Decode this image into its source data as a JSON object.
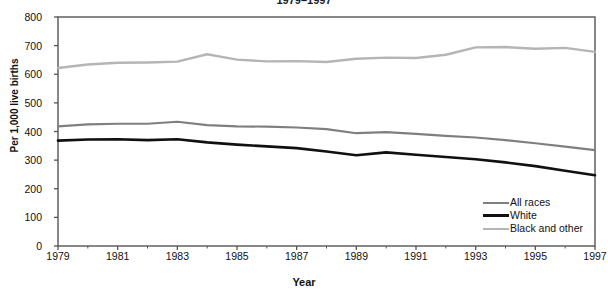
{
  "chart_data": {
    "type": "line",
    "title": "1979–1997",
    "xlabel": "Year",
    "ylabel": "Per 1,000 live births",
    "x": [
      1979,
      1980,
      1981,
      1982,
      1983,
      1984,
      1985,
      1986,
      1987,
      1988,
      1989,
      1990,
      1991,
      1992,
      1993,
      1994,
      1995,
      1996,
      1997
    ],
    "xlim": [
      1979,
      1997
    ],
    "ylim": [
      0,
      800
    ],
    "xticks": [
      1979,
      1981,
      1983,
      1985,
      1987,
      1989,
      1991,
      1993,
      1995,
      1997
    ],
    "xticklabels": [
      "1979",
      "1981",
      "1983",
      "1985",
      "1987",
      "1989",
      "1991",
      "1993",
      "1995",
      "1997"
    ],
    "yticks": [
      0,
      100,
      200,
      300,
      400,
      500,
      600,
      700,
      800
    ],
    "yticklabels": [
      "0",
      "100",
      "200",
      "300",
      "400",
      "500",
      "600",
      "700",
      "800"
    ],
    "grid": false,
    "legend_position": "lower right",
    "series": [
      {
        "name": "All races",
        "color": "#7f7f7f",
        "width": 2.2,
        "values": [
          418,
          425,
          427,
          427,
          434,
          422,
          418,
          417,
          414,
          408,
          394,
          398,
          392,
          385,
          379,
          370,
          359,
          347,
          335
        ]
      },
      {
        "name": "White",
        "color": "#101010",
        "width": 2.6,
        "values": [
          368,
          372,
          373,
          370,
          373,
          362,
          354,
          348,
          342,
          330,
          317,
          327,
          319,
          311,
          303,
          292,
          279,
          263,
          247
        ]
      },
      {
        "name": "Black and other",
        "color": "#b5b5b5",
        "width": 2.4,
        "values": [
          622,
          634,
          640,
          641,
          644,
          670,
          651,
          645,
          646,
          643,
          654,
          658,
          657,
          668,
          694,
          695,
          689,
          692,
          678
        ]
      }
    ]
  },
  "legend": {
    "items": [
      {
        "label": "All races"
      },
      {
        "label": "White"
      },
      {
        "label": "Black and other"
      }
    ]
  },
  "axes": {
    "frame_color": "#555555"
  }
}
